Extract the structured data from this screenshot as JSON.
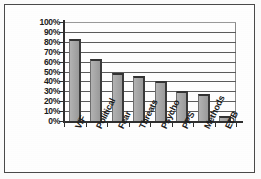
{
  "chart_data": {
    "type": "bar",
    "title": "",
    "subtitle": "",
    "xlabel": "",
    "ylabel": "",
    "categories": [
      "V/F",
      "Political",
      "Fear",
      "Threats",
      "Psycho",
      "PPS",
      "Methods",
      "EDB"
    ],
    "values": [
      83,
      63,
      49,
      45,
      40,
      30,
      27,
      5
    ],
    "value_labels": [
      "83%",
      "63%",
      "49%",
      "45%",
      "40%",
      "30%",
      "27%",
      "5%"
    ],
    "ylim": [
      0,
      100
    ],
    "ytick_labels": [
      "100%",
      "90%",
      "80%",
      "70%",
      "60%",
      "50%",
      "40%",
      "30%",
      "20%",
      "10%",
      "0%"
    ],
    "ytick_values": [
      100,
      90,
      80,
      70,
      60,
      50,
      40,
      30,
      20,
      10,
      0
    ],
    "grid": true,
    "grid_axis": "y",
    "legend": false,
    "legend_position": "none",
    "series": [
      {
        "name": "",
        "values": [
          83,
          63,
          49,
          45,
          40,
          30,
          27,
          5
        ]
      }
    ],
    "colors": {
      "bar_fill": "#a9a9a9",
      "bar_edge": "#333333",
      "axis": "#2f2f2f",
      "grid": "#5c5c5c",
      "text": "#1c1c1c",
      "background": "#ffffff",
      "frame_border": "#4a4a4a"
    }
  }
}
